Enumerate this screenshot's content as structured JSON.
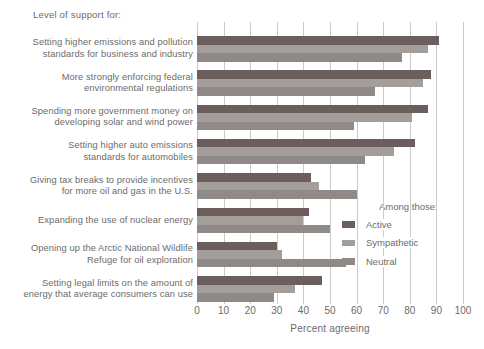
{
  "title": "Level of support for:",
  "chart_data": {
    "type": "bar",
    "orientation": "horizontal",
    "title": "Level of support for:",
    "xlabel": "Percent agreeing",
    "xlim": [
      0,
      100
    ],
    "xticks": [
      0,
      10,
      20,
      30,
      40,
      50,
      60,
      70,
      80,
      90,
      100
    ],
    "grid": true,
    "legend_title": "Among those:",
    "legend_position": "right-bottom",
    "categories": [
      [
        "Setting higher emissions and pollution",
        "standards for business and industry"
      ],
      [
        "More strongly enforcing federal",
        "environmental regulations"
      ],
      [
        "Spending more government money on",
        "developing solar and wind power"
      ],
      [
        "Setting higher auto emissions",
        "standards for automobiles"
      ],
      [
        "Giving tax breaks to provide incentives",
        "for more oil and gas in the U.S."
      ],
      [
        "Expanding the use of nuclear energy"
      ],
      [
        "Opening up the Arctic National Wildlife",
        "Refuge for oil exploration"
      ],
      [
        "Setting legal limits on the amount of",
        "energy that average consumers can use"
      ]
    ],
    "series": [
      {
        "name": "Active",
        "color": "#6d5e5e",
        "values": [
          91,
          88,
          87,
          82,
          43,
          42,
          30,
          47
        ]
      },
      {
        "name": "Sympathetic",
        "color": "#a49e9b",
        "values": [
          87,
          85,
          81,
          74,
          46,
          40,
          32,
          37
        ]
      },
      {
        "name": "Neutral",
        "color": "#8f8a87",
        "values": [
          77,
          67,
          59,
          63,
          60,
          50,
          56,
          29
        ]
      }
    ]
  },
  "colors": {
    "active_bar": "#6d5e5e",
    "sympathetic_bar": "#a49e9b",
    "neutral_bar": "#8f8a87",
    "gridline": "#cbcbcb",
    "text": "#6b6b6b",
    "background": "#ffffff"
  }
}
